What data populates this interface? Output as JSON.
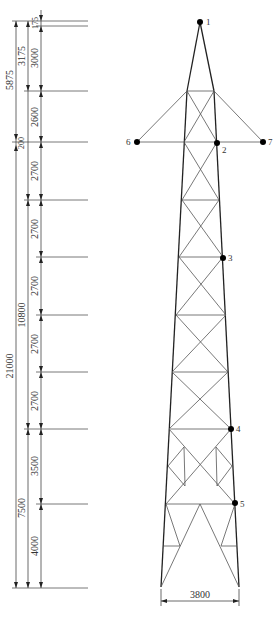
{
  "figure": {
    "type": "transmission-tower-elevation",
    "colors": {
      "line": "#222222",
      "dim": "#444444",
      "text": "#333333",
      "node": "#000000"
    }
  },
  "dimensions": {
    "outer_column": [
      {
        "label": "5875",
        "y1": 21,
        "y2": 140
      },
      {
        "label": "200",
        "y1": 140,
        "y2": 145
      },
      {
        "label": "21000",
        "y1": 145,
        "y2": 588
      }
    ],
    "middle_column": [
      {
        "label": "3175",
        "y1": 21,
        "y2": 91
      },
      {
        "label": "10800",
        "y1": 201,
        "y2": 429
      },
      {
        "label": "7500",
        "y1": 429,
        "y2": 588
      }
    ],
    "inner_column": [
      {
        "label": "175",
        "y1": 21,
        "y2": 26
      },
      {
        "label": "3000",
        "y1": 26,
        "y2": 91
      },
      {
        "label": "2600",
        "y1": 91,
        "y2": 142
      },
      {
        "label": "2700",
        "y1": 142,
        "y2": 200
      },
      {
        "label": "2700",
        "y1": 200,
        "y2": 257
      },
      {
        "label": "2700",
        "y1": 257,
        "y2": 315
      },
      {
        "label": "2700",
        "y1": 315,
        "y2": 372
      },
      {
        "label": "2700",
        "y1": 372,
        "y2": 429
      },
      {
        "label": "3500",
        "y1": 429,
        "y2": 503
      },
      {
        "label": "4000",
        "y1": 503,
        "y2": 588
      }
    ],
    "base_width": {
      "label": "3800",
      "x1": 161,
      "x2": 239,
      "y": 601
    }
  },
  "nodes": [
    {
      "id": "1",
      "x": 200,
      "y": 22,
      "lx": 206,
      "ly": 25
    },
    {
      "id": "2",
      "x": 217,
      "y": 143,
      "lx": 222,
      "ly": 153
    },
    {
      "id": "3",
      "x": 223,
      "y": 258,
      "lx": 228,
      "ly": 261
    },
    {
      "id": "4",
      "x": 231,
      "y": 429,
      "lx": 236,
      "ly": 432
    },
    {
      "id": "5",
      "x": 235,
      "y": 503,
      "lx": 240,
      "ly": 507
    },
    {
      "id": "6",
      "x": 137,
      "y": 142,
      "lx": 127,
      "ly": 145
    },
    {
      "id": "7",
      "x": 263,
      "y": 142,
      "lx": 268,
      "ly": 145
    }
  ],
  "labels": {
    "n1": "1",
    "n2": "2",
    "n3": "3",
    "n4": "4",
    "n5": "5",
    "n6": "6",
    "n7": "7",
    "d5875": "5875",
    "d200": "200",
    "d21000": "21000",
    "d3175": "3175",
    "d10800": "10800",
    "d7500": "7500",
    "d175": "175",
    "d3000": "3000",
    "d2600": "2600",
    "d2700a": "2700",
    "d2700b": "2700",
    "d2700c": "2700",
    "d2700d": "2700",
    "d2700e": "2700",
    "d3500": "3500",
    "d4000": "4000",
    "d3800": "3800"
  }
}
